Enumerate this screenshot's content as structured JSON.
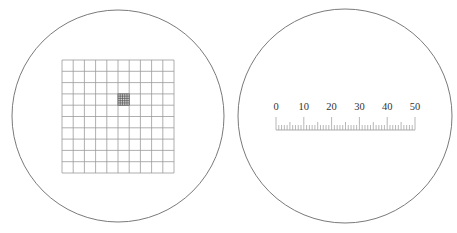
{
  "left_view": {
    "name": "counting-grid-reticle",
    "circle": {
      "cx": 118,
      "cy": 116,
      "r": 106
    },
    "grid": {
      "x": 62,
      "y": 60,
      "width": 112,
      "height": 113,
      "rows": 10,
      "cols": 10
    },
    "fine_cell": {
      "col": 5,
      "row": 3,
      "subdivisions": 5
    }
  },
  "right_view": {
    "name": "micrometer-scale-reticle",
    "circle": {
      "cx": 345,
      "cy": 116,
      "r": 107
    },
    "scale": {
      "labels": [
        "0",
        "10",
        "20",
        "30",
        "40",
        "50"
      ],
      "min": 0,
      "max": 50,
      "major_step": 10,
      "minor_step": 1,
      "x_start": 276,
      "x_end": 415,
      "baseline_y": 130,
      "major_top_y": 117,
      "mid_top_y": 122,
      "minor_top_y": 125,
      "label_y": 110
    }
  },
  "colors": {
    "stroke": "#7a7a7a",
    "grid": "#9a9a9a",
    "fine": "#555555",
    "text": "#333333"
  }
}
